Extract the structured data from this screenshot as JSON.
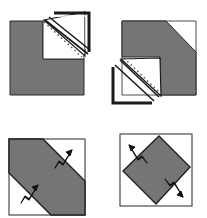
{
  "figure": {
    "width": 207,
    "height": 218,
    "background_color": "#ffffff",
    "colors": {
      "paper_shaded": "#757575",
      "paper_white": "#ffffff",
      "outline_dark": "#1a1a1a",
      "outline_mid": "#3c3c3c",
      "fold_dash": "#4d4d4d",
      "square_border": "#404040",
      "arrow_fill": "#ffffff",
      "arrow_stroke": "#111111"
    },
    "panels": [
      {
        "id": "panel-top-left",
        "position": "top-left",
        "label": "Step 1",
        "shape": "square-with-notch",
        "has_flap": true,
        "flap_direction": "up-right",
        "fold_line_style": "dashed",
        "arrow_count": 0,
        "bounds": {
          "x": 8,
          "y": 10,
          "width": 86,
          "height": 92
        },
        "shaded_square": {
          "x": 10,
          "y": 21,
          "width": 74,
          "height": 74
        },
        "notch": {
          "x": 43,
          "y": 21,
          "width": 41,
          "height": 38
        }
      },
      {
        "id": "panel-top-right",
        "position": "top-right",
        "label": "Step 2",
        "shape": "square-with-notch",
        "has_flap": true,
        "flap_direction": "down-left",
        "fold_line_style": "dashed",
        "arrow_count": 0,
        "bounds": {
          "x": 112,
          "y": 14,
          "width": 86,
          "height": 92
        },
        "shaded_square": {
          "x": 122,
          "y": 21,
          "width": 74,
          "height": 74
        },
        "notch": {
          "x": 122,
          "y": 57,
          "width": 38,
          "height": 38
        }
      },
      {
        "id": "panel-bottom-left",
        "position": "bottom-left",
        "label": "Step 3",
        "shape": "square-with-diagonal-band",
        "has_flap": false,
        "band_orientation": "diagonal-nw-se",
        "fold_line_style": "solid",
        "arrow_count": 2,
        "bounds": {
          "x": 9,
          "y": 139,
          "width": 76,
          "height": 76
        }
      },
      {
        "id": "panel-bottom-right",
        "position": "bottom-right",
        "label": "Step 4",
        "shape": "square-with-rotated-square",
        "has_flap": false,
        "band_orientation": "diamond",
        "fold_line_style": "solid",
        "arrow_count": 2,
        "bounds": {
          "x": 120,
          "y": 134,
          "width": 72,
          "height": 72
        }
      }
    ],
    "arrows": [
      {
        "id": "arrow-bl-upper",
        "panel": "panel-bottom-left",
        "direction": "down-left",
        "x": 64,
        "y": 156
      },
      {
        "id": "arrow-bl-lower",
        "panel": "panel-bottom-left",
        "direction": "down-left",
        "x": 30,
        "y": 191
      },
      {
        "id": "arrow-br-upper",
        "panel": "panel-bottom-right",
        "direction": "up-left",
        "x": 141,
        "y": 157
      },
      {
        "id": "arrow-br-lower",
        "panel": "panel-bottom-right",
        "direction": "down-right",
        "x": 176,
        "y": 190
      }
    ]
  }
}
